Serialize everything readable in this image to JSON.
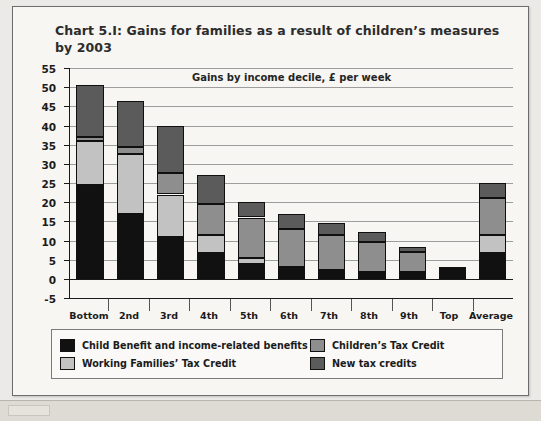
{
  "chart_title": "Chart 5.I:  Gains for families as a result of children’s measures by 2003",
  "legend": {
    "items": [
      {
        "label": "Child Benefit and income-related benefits",
        "color": "#111111",
        "name": "child-benefit"
      },
      {
        "label": "Children’s Tax Credit",
        "color": "#8e8e8e",
        "name": "childrens-tax-credit"
      },
      {
        "label": "Working Families’ Tax Credit",
        "color": "#c2c2c2",
        "name": "working-families-tax-credit"
      },
      {
        "label": "New tax credits",
        "color": "#5b5b5b",
        "name": "new-tax-credits"
      }
    ]
  },
  "chart_data": {
    "type": "bar",
    "subtype": "stacked",
    "title": "Chart 5.I:  Gains for families as a result of children’s measures by 2003",
    "subtitle": "Gains by income decile, £ per week",
    "xlabel": "",
    "ylabel": "",
    "ylim": [
      -5,
      55
    ],
    "ytick_step": 5,
    "yticks": [
      55,
      50,
      45,
      40,
      35,
      30,
      25,
      20,
      15,
      10,
      5,
      0,
      -5
    ],
    "grid": true,
    "legend_position": "bottom",
    "categories": [
      "Bottom",
      "2nd",
      "3rd",
      "4th",
      "5th",
      "6th",
      "7th",
      "8th",
      "9th",
      "Top",
      "Average"
    ],
    "series": [
      {
        "name": "Child Benefit and income-related benefits",
        "color": "#111111",
        "values": [
          24.5,
          17.0,
          11.0,
          6.7,
          4.0,
          3.0,
          2.3,
          1.8,
          1.8,
          2.5,
          6.7
        ]
      },
      {
        "name": "Working Families’ Tax Credit",
        "color": "#c2c2c2",
        "values": [
          11.5,
          15.5,
          11.0,
          4.8,
          1.5,
          0.0,
          0.0,
          0.0,
          0.0,
          0.0,
          4.8
        ]
      },
      {
        "name": "Children’s Tax Credit",
        "color": "#8e8e8e",
        "values": [
          1.0,
          2.0,
          5.5,
          8.0,
          10.5,
          10.0,
          9.2,
          7.7,
          5.2,
          0.0,
          9.5
        ]
      },
      {
        "name": "New tax credits",
        "color": "#5b5b5b",
        "values": [
          13.5,
          12.0,
          12.5,
          7.5,
          4.0,
          4.0,
          3.0,
          2.8,
          1.2,
          0.7,
          4.0
        ]
      }
    ],
    "totals": [
      50.5,
      46.5,
      40.0,
      27.0,
      20.0,
      17.0,
      14.5,
      12.3,
      8.2,
      3.2,
      25.0
    ]
  }
}
